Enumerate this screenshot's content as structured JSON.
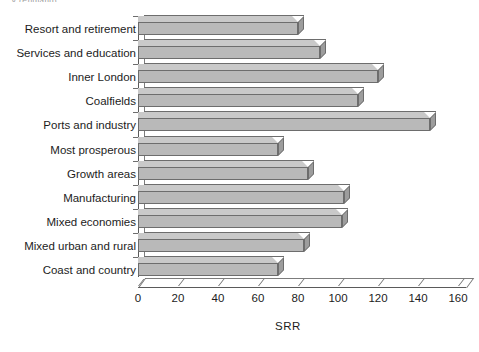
{
  "page": {
    "cut_caption_fragment": "...y (England)"
  },
  "chart_data": {
    "type": "bar",
    "orientation": "horizontal",
    "title": "",
    "subtitle": "",
    "xlabel": "SRR",
    "ylabel": "",
    "xlim": [
      0,
      160
    ],
    "xticks": [
      0,
      20,
      40,
      60,
      80,
      100,
      120,
      140,
      160
    ],
    "xtick_labels": [
      "0",
      "20",
      "40",
      "60",
      "80",
      "100",
      "120",
      "140",
      "160"
    ],
    "grid": false,
    "legend": null,
    "style": "3d-bar",
    "bar_color": "#b9b9b9",
    "bar_edge_color": "#6d6d6d",
    "bar_top_color": "#c9c9c9",
    "bar_side_color": "#9d9d9d",
    "background": "#ffffff",
    "categories": [
      "Resort and retirement",
      "Services and education",
      "Inner London",
      "Coalfields",
      "Ports and industry",
      "Most prosperous",
      "Growth areas",
      "Manufacturing",
      "Mixed economies",
      "Mixed urban and rural",
      "Coast and country"
    ],
    "values": [
      80,
      91,
      120,
      110,
      146,
      70,
      85,
      103,
      102,
      83,
      70
    ],
    "series": [
      {
        "name": "SRR",
        "values": [
          80,
          91,
          120,
          110,
          146,
          70,
          85,
          103,
          102,
          83,
          70
        ]
      }
    ]
  }
}
